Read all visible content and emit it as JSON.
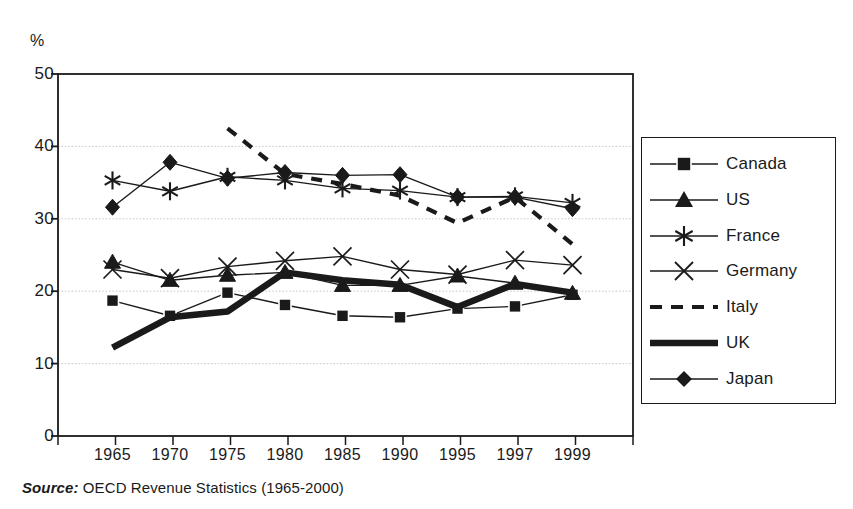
{
  "chart_data": {
    "type": "line",
    "title": "",
    "xlabel": "",
    "ylabel": "%",
    "ylim": [
      0,
      50
    ],
    "yticks": [
      0,
      10,
      20,
      30,
      40,
      50
    ],
    "grid": "horizontal-dotted",
    "legend_position": "right-outside",
    "categories": [
      "1965",
      "1970",
      "1975",
      "1980",
      "1985",
      "1990",
      "1995",
      "1997",
      "1999"
    ],
    "series": [
      {
        "name": "Canada",
        "marker": "filled-square",
        "line": "thin-solid",
        "values": [
          18.7,
          16.6,
          19.8,
          18.1,
          16.6,
          16.4,
          17.6,
          17.9,
          19.5
        ]
      },
      {
        "name": "US",
        "marker": "filled-triangle",
        "line": "thin-solid",
        "values": [
          24.0,
          21.5,
          22.2,
          22.6,
          20.8,
          20.8,
          22.1,
          21.1,
          19.7
        ]
      },
      {
        "name": "France",
        "marker": "asterisk",
        "line": "thin-solid",
        "values": [
          35.3,
          33.8,
          35.8,
          35.3,
          34.2,
          33.9,
          33.0,
          33.1,
          32.2
        ]
      },
      {
        "name": "Germany",
        "marker": "cross-x",
        "line": "thin-solid",
        "values": [
          23.0,
          21.8,
          23.4,
          24.2,
          24.8,
          23.0,
          22.3,
          24.3,
          23.6
        ]
      },
      {
        "name": "Italy",
        "marker": "none",
        "line": "dashed",
        "values": [
          null,
          null,
          42.5,
          36.2,
          34.8,
          33.2,
          29.4,
          33.0,
          26.5
        ]
      },
      {
        "name": "UK",
        "marker": "none",
        "line": "thick-solid",
        "values": [
          12.2,
          16.4,
          17.2,
          22.6,
          21.5,
          20.9,
          17.8,
          21.0,
          19.8
        ]
      },
      {
        "name": "Japan",
        "marker": "filled-diamond",
        "line": "thin-solid",
        "values": [
          31.6,
          37.8,
          35.6,
          36.4,
          36.0,
          36.1,
          33.0,
          33.0,
          31.4
        ]
      }
    ]
  },
  "axis": {
    "unit_label": "%",
    "y_tick_labels": [
      "50",
      "40",
      "30",
      "20",
      "10",
      "0"
    ],
    "x_tick_labels": [
      "1965",
      "1970",
      "1975",
      "1980",
      "1985",
      "1990",
      "1995",
      "1997",
      "1999"
    ]
  },
  "legend": {
    "items": [
      {
        "label": "Canada",
        "marker": "filled-square",
        "line": "thin-solid"
      },
      {
        "label": "US",
        "marker": "filled-triangle",
        "line": "thin-solid"
      },
      {
        "label": "France",
        "marker": "asterisk",
        "line": "thin-solid"
      },
      {
        "label": "Germany",
        "marker": "cross-x",
        "line": "thin-solid"
      },
      {
        "label": "Italy",
        "marker": "none",
        "line": "dashed"
      },
      {
        "label": "UK",
        "marker": "none",
        "line": "thick-solid"
      },
      {
        "label": "Japan",
        "marker": "filled-diamond",
        "line": "thin-solid"
      }
    ]
  },
  "source": {
    "prefix": "Source:",
    "text": " OECD Revenue Statistics (1965-2000)"
  },
  "colors": {
    "ink": "#1a1a1a",
    "grid": "#c9c9c9",
    "background": "#ffffff"
  }
}
